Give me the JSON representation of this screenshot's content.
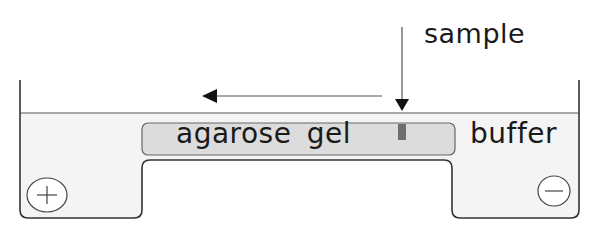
{
  "diagram": {
    "labels": {
      "sample": "sample",
      "gel": "agarose gel",
      "buffer": "buffer"
    },
    "electrodes": {
      "anode": {
        "symbol": "+",
        "side": "left"
      },
      "cathode": {
        "symbol": "−",
        "side": "right"
      }
    },
    "arrows": {
      "migration": {
        "direction": "left",
        "meaning": "direction of sample migration"
      },
      "sample_loading": {
        "direction": "down",
        "meaning": "sample loaded into well"
      }
    },
    "colors": {
      "outline": "#333333",
      "buffer_fill": "#f4f4f4",
      "gel_fill": "#dcdcdc",
      "well_fill": "#6e6e6e",
      "text": "#1a1a1a"
    }
  }
}
